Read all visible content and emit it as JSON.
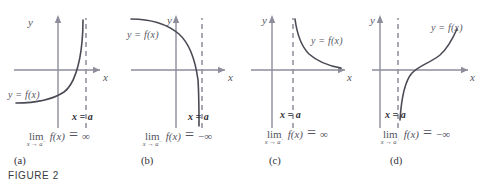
{
  "figure": {
    "number_label": "FIGURE 2",
    "axis_x_label": "x",
    "axis_y_label": "y",
    "asymptote_label": "x = a",
    "curve_label": "y = f(x)",
    "lim_word": "lim",
    "fx": "f(x)",
    "equals": "=",
    "infinity": "∞",
    "neg_infinity": "−∞",
    "colors": {
      "axis": "#8d8d9c",
      "curve": "#4a4a55",
      "dashed": "#8d8d9c",
      "text": "#55555f",
      "bold_text": "#2f2f38"
    },
    "panels": [
      {
        "caption": "(a)",
        "curve_label": "y = f(x)",
        "asymptote_label": "x = a",
        "lim_word": "lim",
        "lim_sub_base": "x → a",
        "lim_sub_sign": "−",
        "lim_value": "∞",
        "description": "curve rises steeply to +infinity as x approaches a from the left"
      },
      {
        "caption": "(b)",
        "curve_label": "y = f(x)",
        "asymptote_label": "x = a",
        "lim_word": "lim",
        "lim_sub_base": "x → a",
        "lim_sub_sign": "−",
        "lim_value": "−∞",
        "description": "curve falls steeply to -infinity as x approaches a from the left"
      },
      {
        "caption": "(c)",
        "curve_label": "y = f(x)",
        "asymptote_label": "x = a",
        "lim_word": "lim",
        "lim_sub_base": "x → a",
        "lim_sub_sign": "+",
        "lim_value": "∞",
        "description": "curve descends from +infinity just right of a toward the x-axis"
      },
      {
        "caption": "(d)",
        "curve_label": "y = f(x)",
        "asymptote_label": "x = a",
        "lim_word": "lim",
        "lim_sub_base": "x → a",
        "lim_sub_sign": "+",
        "lim_value": "−∞",
        "description": "curve rises from -infinity just right of a through the origin region"
      }
    ]
  }
}
